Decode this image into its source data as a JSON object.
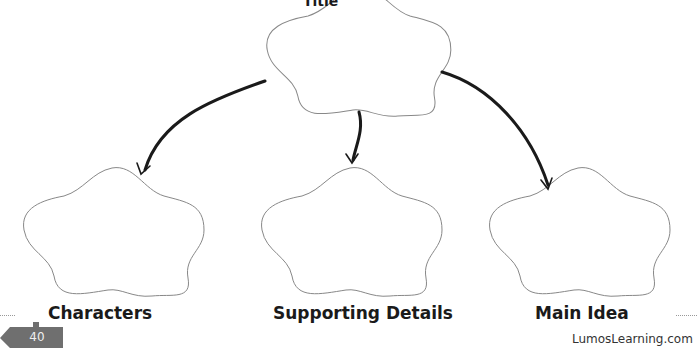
{
  "organizer": {
    "top_box": {
      "label": "Title"
    },
    "boxes": [
      {
        "label": "Characters"
      },
      {
        "label": "Supporting Details"
      },
      {
        "label": "Main Idea"
      }
    ]
  },
  "footer": {
    "page_number": "40",
    "site": "LumosLearning.com"
  },
  "colors": {
    "outline": "#888888",
    "arrow": "#1a1a1a",
    "page_tab": "#6f6f6f"
  }
}
